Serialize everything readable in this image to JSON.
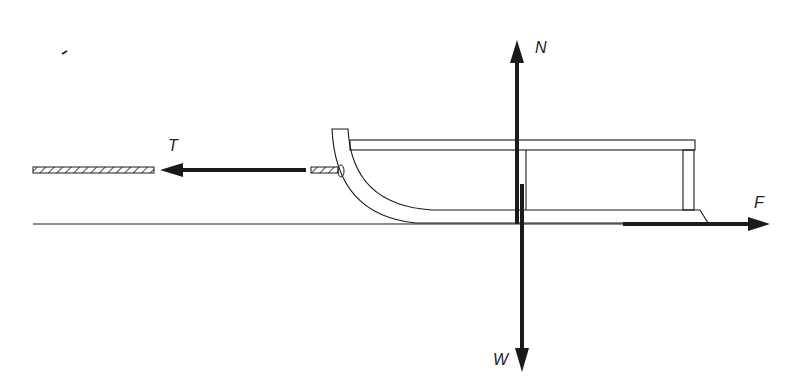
{
  "diagram": {
    "colors": {
      "stroke": "#1a1a1a",
      "arrow": "#1a1a1a",
      "background": "#ffffff"
    },
    "forces": [
      {
        "id": "tension",
        "label": "T",
        "direction": "left"
      },
      {
        "id": "normal",
        "label": "N",
        "direction": "up"
      },
      {
        "id": "weight",
        "label": "W",
        "direction": "down"
      },
      {
        "id": "friction",
        "label": "F",
        "direction": "right"
      }
    ]
  }
}
